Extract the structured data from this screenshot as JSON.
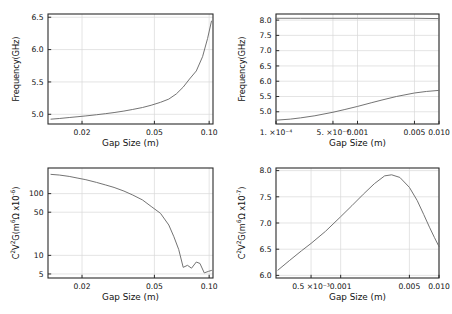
{
  "figure": {
    "background": "#ffffff",
    "frame_color": "#2b2b2b",
    "grid_color": "#d8d8d8",
    "curve_color": "#6b6b6b"
  },
  "chart_data": [
    {
      "id": "top-left",
      "type": "line",
      "title": "",
      "xlabel": "Gap Size (m)",
      "ylabel": "Frequency(GHz)",
      "xscale": "log",
      "yscale": "linear",
      "xlim": [
        0.013,
        0.105
      ],
      "ylim": [
        4.85,
        6.55
      ],
      "grid": true,
      "legend": "none",
      "xticks": [
        0.02,
        0.05,
        0.1
      ],
      "xticklabels": [
        "0.02",
        "0.05",
        "0.10"
      ],
      "yticks": [
        5.0,
        5.5,
        6.0,
        6.5
      ],
      "yticklabels": [
        "5.0",
        "5.5",
        "6.0",
        "6.5"
      ],
      "series": [
        {
          "name": "frequency",
          "x": [
            0.0135,
            0.015,
            0.017,
            0.019,
            0.021,
            0.024,
            0.027,
            0.03,
            0.034,
            0.038,
            0.043,
            0.048,
            0.054,
            0.06,
            0.066,
            0.072,
            0.078,
            0.085,
            0.092,
            0.098,
            0.103
          ],
          "y": [
            4.925,
            4.935,
            4.95,
            4.963,
            4.975,
            4.993,
            5.01,
            5.027,
            5.05,
            5.075,
            5.105,
            5.14,
            5.185,
            5.235,
            5.315,
            5.42,
            5.545,
            5.67,
            5.89,
            6.17,
            6.44
          ]
        }
      ]
    },
    {
      "id": "top-right",
      "type": "line",
      "title": "",
      "xlabel": "Gap Size (m)",
      "ylabel": "Frequency(GHz)",
      "xscale": "log",
      "yscale": "linear",
      "xlim": [
        0.0001,
        0.01
      ],
      "ylim": [
        4.6,
        8.2
      ],
      "grid": true,
      "legend": "none",
      "xticks": [
        0.0001,
        0.0005,
        0.001,
        0.005,
        0.01
      ],
      "xticklabels": [
        "1. ×10⁻⁴",
        "5. ×10⁻⁴",
        "0.001",
        "0.005",
        "0.010"
      ],
      "yticks": [
        5.0,
        5.5,
        6.0,
        6.5,
        7.0,
        7.5,
        8.0
      ],
      "yticklabels": [
        "5.0",
        "5.5",
        "6.0",
        "6.5",
        "7.0",
        "7.5",
        "8.0"
      ],
      "series": [
        {
          "name": "upper-mode",
          "x": [
            0.0001,
            0.0002,
            0.0005,
            0.001,
            0.002,
            0.005,
            0.01
          ],
          "y": [
            8.06,
            8.06,
            8.06,
            8.06,
            8.06,
            8.06,
            8.05
          ]
        },
        {
          "name": "lower-mode",
          "x": [
            0.0001,
            0.00015,
            0.0002,
            0.0003,
            0.0005,
            0.0007,
            0.001,
            0.0015,
            0.002,
            0.003,
            0.005,
            0.007,
            0.01
          ],
          "y": [
            4.725,
            4.76,
            4.8,
            4.87,
            4.985,
            5.075,
            5.175,
            5.3,
            5.385,
            5.5,
            5.615,
            5.665,
            5.7
          ]
        }
      ]
    },
    {
      "id": "bottom-left",
      "type": "line",
      "title": "",
      "xlabel": "Gap Size (m)",
      "ylabel": "C²V²G(m⁶Ω x10⁻⁶)",
      "xscale": "log",
      "yscale": "log",
      "xlim": [
        0.013,
        0.105
      ],
      "ylim": [
        4.3,
        260
      ],
      "grid": true,
      "legend": "none",
      "xticks": [
        0.02,
        0.05,
        0.1
      ],
      "xticklabels": [
        "0.02",
        "0.05",
        "0.10"
      ],
      "yticks": [
        5,
        10,
        50,
        100
      ],
      "yticklabels": [
        "5",
        "10",
        "50",
        "100"
      ],
      "series": [
        {
          "name": "cvg",
          "x": [
            0.0135,
            0.015,
            0.017,
            0.019,
            0.021,
            0.024,
            0.027,
            0.03,
            0.034,
            0.038,
            0.043,
            0.048,
            0.054,
            0.06,
            0.064,
            0.068,
            0.072,
            0.076,
            0.08,
            0.085,
            0.089,
            0.094,
            0.099,
            0.103
          ],
          "y": [
            205,
            200,
            190,
            178,
            168,
            152,
            138,
            126,
            110,
            95,
            79,
            62,
            48,
            31,
            20,
            12.5,
            6.4,
            6.9,
            6.2,
            7.8,
            7.4,
            5.2,
            5.5,
            5.7
          ]
        }
      ]
    },
    {
      "id": "bottom-right",
      "type": "line",
      "title": "",
      "xlabel": "Gap Size (m)",
      "ylabel": "C²V²G(m⁶Ω x10⁻⁷)",
      "xscale": "log",
      "yscale": "linear",
      "xlim": [
        0.00022,
        0.01
      ],
      "ylim": [
        5.95,
        8.05
      ],
      "grid": true,
      "legend": "none",
      "xticks": [
        0.0005,
        0.001,
        0.005,
        0.01
      ],
      "xticklabels": [
        "0.5 ×10⁻³",
        "0.001",
        "0.005",
        "0.010"
      ],
      "yticks": [
        6.0,
        6.5,
        7.0,
        7.5,
        8.0
      ],
      "yticklabels": [
        "6.0",
        "6.5",
        "7.0",
        "7.5",
        "8.0"
      ],
      "series": [
        {
          "name": "cvg",
          "x": [
            0.00023,
            0.0003,
            0.0004,
            0.0005,
            0.0007,
            0.001,
            0.0013,
            0.0017,
            0.0022,
            0.0028,
            0.0033,
            0.004,
            0.005,
            0.006,
            0.007,
            0.008,
            0.009,
            0.01
          ],
          "y": [
            6.1,
            6.28,
            6.47,
            6.61,
            6.84,
            7.12,
            7.33,
            7.55,
            7.75,
            7.9,
            7.92,
            7.87,
            7.68,
            7.43,
            7.16,
            6.92,
            6.72,
            6.55
          ]
        }
      ]
    }
  ]
}
